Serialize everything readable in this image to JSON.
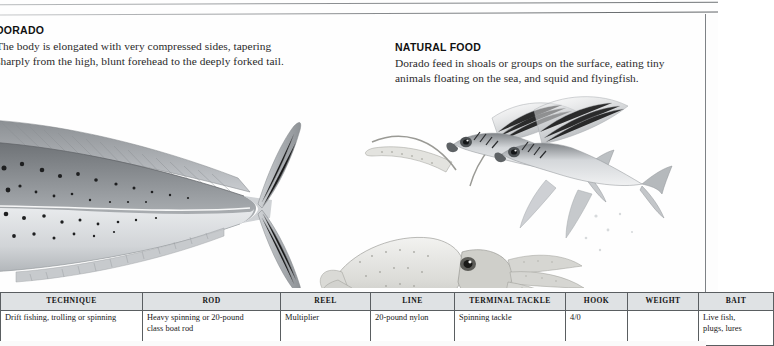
{
  "document": {
    "type": "fish-identification-page",
    "species": "Dorado"
  },
  "sections": {
    "dorado": {
      "heading": "DORADO",
      "lines": [
        "The body is elongated with very compressed sides, tapering",
        "sharply from the high, blunt forehead to the deeply forked tail."
      ]
    },
    "natural_food": {
      "heading": "NATURAL FOOD",
      "lines": [
        "Dorado feed in shoals or groups on the surface, eating tiny",
        "animals floating on the sea, and squid and flyingfish."
      ]
    }
  },
  "illustration": {
    "caption_items": [
      "dorado-body",
      "squid",
      "flyingfish-upper",
      "flyingfish-lower"
    ],
    "style": "grayscale pencil airbrush"
  },
  "spec_table": {
    "headers": [
      "TECHNIQUE",
      "ROD",
      "REEL",
      "LINE",
      "TERMINAL TACKLE",
      "HOOK",
      "WEIGHT",
      "BAIT"
    ],
    "row": {
      "technique": "Drift fishing, trolling or spinning",
      "rod_line1": "Heavy spinning or 20-pound",
      "rod_line2": "class boat rod",
      "reel": "Multiplier",
      "line": "20-pound nylon",
      "terminal_tackle": "Spinning tackle",
      "hook": "4/0",
      "weight": "",
      "bait_line1": "Live fish,",
      "bait_line2": "plugs, lures"
    }
  },
  "colors": {
    "page_background": "#fefefe",
    "text": "#1b1b1b",
    "table_header_fill": "#dfe2e4",
    "table_border": "#5a5e61",
    "rule_line": "#7e8286"
  }
}
